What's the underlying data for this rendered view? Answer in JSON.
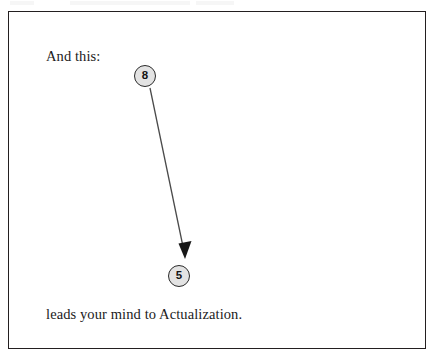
{
  "figure": {
    "caption_top": "And this:",
    "caption_bottom": "leads your mind to Actualization.",
    "frame_color": "#231f20",
    "background_color": "#ffffff",
    "text_color": "#1b1b1b",
    "nodes": [
      {
        "id": "node-8",
        "label": "8",
        "role": "source",
        "center_x": 145,
        "center_y": 76,
        "diameter": 22,
        "fill_color": "#e3e3e3",
        "stroke_color": "#2b2b2b"
      },
      {
        "id": "node-5",
        "label": "5",
        "role": "target",
        "center_x": 179,
        "center_y": 276,
        "diameter": 22,
        "fill_color": "#e3e3e3",
        "stroke_color": "#2b2b2b"
      }
    ],
    "connector": {
      "from": "8",
      "to": "5",
      "style": "straight-arrow",
      "head": "solid-triangle",
      "color": "#4a4a4a",
      "start_x": 150,
      "start_y": 88,
      "end_x": 185,
      "end_y": 259
    }
  }
}
